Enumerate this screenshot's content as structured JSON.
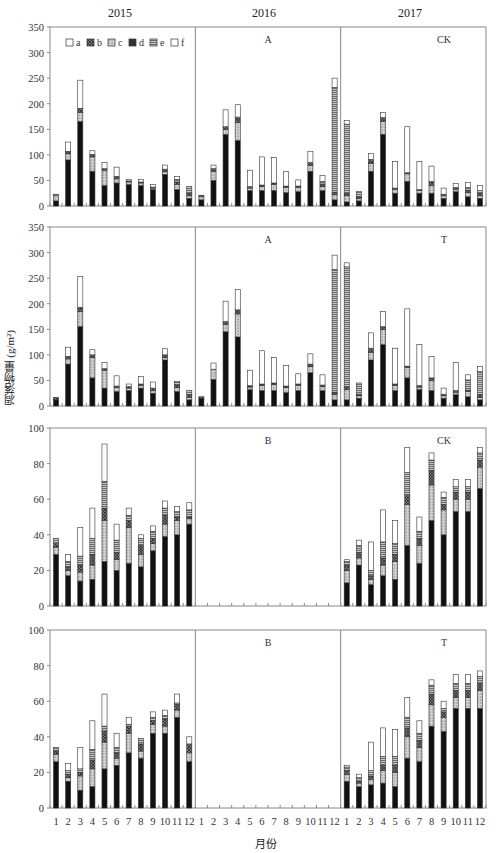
{
  "years": [
    "2015",
    "2016",
    "2017"
  ],
  "y_axis_label": "凋落物量 (g/m²)",
  "x_axis_label": "月份",
  "months": [
    "1",
    "2",
    "3",
    "4",
    "5",
    "6",
    "7",
    "8",
    "9",
    "10",
    "11",
    "12"
  ],
  "legend": [
    {
      "key": "a",
      "label": "a",
      "pattern": "white"
    },
    {
      "key": "b",
      "label": "b",
      "pattern": "crosshatch-dark"
    },
    {
      "key": "c",
      "label": "c",
      "pattern": "stipple-light"
    },
    {
      "key": "d",
      "label": "d",
      "pattern": "black"
    },
    {
      "key": "e",
      "label": "e",
      "pattern": "hlines"
    },
    {
      "key": "f",
      "label": "f",
      "pattern": "white"
    }
  ],
  "colors": {
    "d": "#111111",
    "b": "#6a6a6a",
    "c": "#b4b4b4",
    "e": "#8c8c8c",
    "f": "#ffffff",
    "axis": "#777777"
  },
  "chart_data": [
    {
      "type": "bar",
      "stacked": true,
      "panel_label_left": "A",
      "panel_label_right": "CK",
      "ylim": [
        0,
        350
      ],
      "yticks": [
        0,
        50,
        100,
        150,
        200,
        250,
        300,
        350
      ],
      "segment_order": [
        "d",
        "c",
        "b",
        "e",
        "f"
      ],
      "series_values": {
        "d": [
          10,
          90,
          165,
          68,
          40,
          45,
          42,
          40,
          32,
          62,
          32,
          15,
          12,
          50,
          140,
          128,
          30,
          30,
          30,
          26,
          28,
          68,
          30,
          12,
          8,
          10,
          68,
          140,
          25,
          48,
          25,
          25,
          15,
          28,
          18,
          15
        ],
        "c": [
          10,
          12,
          18,
          28,
          30,
          8,
          5,
          5,
          3,
          5,
          10,
          5,
          6,
          18,
          10,
          35,
          5,
          8,
          12,
          10,
          8,
          12,
          8,
          10,
          12,
          5,
          15,
          25,
          8,
          15,
          5,
          15,
          5,
          5,
          8,
          5
        ],
        "b": [
          0,
          5,
          8,
          5,
          3,
          5,
          2,
          2,
          2,
          5,
          5,
          5,
          3,
          5,
          5,
          8,
          3,
          3,
          3,
          3,
          3,
          5,
          5,
          5,
          5,
          3,
          8,
          8,
          2,
          2,
          2,
          8,
          3,
          3,
          5,
          5
        ],
        "e": [
          3,
          0,
          0,
          0,
          0,
          0,
          0,
          0,
          0,
          0,
          5,
          13,
          0,
          0,
          0,
          3,
          0,
          0,
          0,
          0,
          0,
          0,
          5,
          205,
          135,
          10,
          0,
          0,
          0,
          0,
          0,
          0,
          0,
          0,
          5,
          5
        ],
        "f": [
          0,
          18,
          55,
          7,
          12,
          18,
          3,
          5,
          5,
          8,
          6,
          0,
          0,
          7,
          33,
          24,
          32,
          55,
          50,
          28,
          12,
          22,
          12,
          18,
          7,
          0,
          12,
          10,
          52,
          90,
          55,
          30,
          12,
          8,
          10,
          10
        ]
      }
    },
    {
      "type": "bar",
      "stacked": true,
      "panel_label_left": "A",
      "panel_label_right": "T",
      "ylim": [
        0,
        350
      ],
      "yticks": [
        0,
        50,
        100,
        150,
        200,
        250,
        300,
        350
      ],
      "segment_order": [
        "d",
        "c",
        "b",
        "e",
        "f"
      ],
      "series_values": {
        "d": [
          12,
          82,
          155,
          55,
          35,
          28,
          30,
          35,
          25,
          90,
          28,
          12,
          15,
          52,
          145,
          135,
          32,
          30,
          30,
          26,
          30,
          65,
          30,
          12,
          12,
          15,
          90,
          120,
          30,
          55,
          32,
          30,
          15,
          22,
          18,
          12
        ],
        "c": [
          0,
          10,
          30,
          40,
          35,
          8,
          5,
          5,
          5,
          5,
          8,
          5,
          0,
          20,
          15,
          45,
          5,
          10,
          12,
          10,
          10,
          12,
          8,
          10,
          20,
          5,
          15,
          30,
          10,
          20,
          5,
          20,
          5,
          5,
          10,
          5
        ],
        "b": [
          5,
          5,
          8,
          5,
          3,
          3,
          3,
          3,
          5,
          5,
          5,
          5,
          3,
          0,
          5,
          8,
          3,
          3,
          3,
          3,
          3,
          5,
          3,
          5,
          5,
          3,
          8,
          5,
          3,
          3,
          3,
          5,
          3,
          3,
          3,
          5
        ],
        "e": [
          0,
          0,
          0,
          0,
          0,
          0,
          0,
          0,
          0,
          0,
          5,
          8,
          0,
          0,
          0,
          0,
          0,
          0,
          0,
          0,
          0,
          0,
          0,
          240,
          235,
          22,
          0,
          0,
          0,
          0,
          0,
          0,
          0,
          0,
          20,
          45
        ],
        "f": [
          0,
          18,
          60,
          10,
          12,
          20,
          5,
          15,
          12,
          12,
          2,
          0,
          0,
          12,
          40,
          40,
          30,
          65,
          50,
          40,
          20,
          20,
          20,
          28,
          8,
          0,
          30,
          30,
          70,
          112,
          80,
          42,
          12,
          55,
          10,
          10
        ]
      }
    },
    {
      "type": "bar",
      "stacked": true,
      "panel_label_left": "B",
      "panel_label_right": "CK",
      "ylim": [
        0,
        100
      ],
      "yticks": [
        0,
        20,
        40,
        60,
        80,
        100
      ],
      "segment_order": [
        "d",
        "c",
        "b",
        "e",
        "f"
      ],
      "series_values": {
        "d": [
          29,
          17,
          14,
          15,
          25,
          20,
          24,
          22,
          31,
          39,
          40,
          46,
          0,
          0,
          0,
          0,
          0,
          0,
          0,
          0,
          0,
          0,
          0,
          0,
          13,
          23,
          12,
          17,
          15,
          34,
          24,
          48,
          40,
          53,
          53,
          66
        ],
        "c": [
          4,
          3,
          5,
          8,
          23,
          6,
          20,
          7,
          4,
          7,
          8,
          3,
          0,
          0,
          0,
          0,
          0,
          0,
          0,
          0,
          0,
          0,
          0,
          0,
          7,
          4,
          3,
          6,
          10,
          23,
          10,
          20,
          14,
          7,
          7,
          12
        ],
        "b": [
          2,
          2,
          4,
          6,
          7,
          4,
          4,
          5,
          3,
          5,
          2,
          1,
          0,
          0,
          0,
          0,
          0,
          0,
          0,
          0,
          0,
          0,
          0,
          0,
          3,
          3,
          2,
          4,
          4,
          5,
          4,
          8,
          3,
          4,
          4,
          4
        ],
        "e": [
          3,
          3,
          5,
          9,
          15,
          7,
          3,
          4,
          4,
          4,
          3,
          4,
          0,
          0,
          0,
          0,
          0,
          0,
          0,
          0,
          0,
          0,
          0,
          0,
          2,
          4,
          3,
          9,
          6,
          13,
          4,
          6,
          4,
          3,
          3,
          4
        ],
        "f": [
          0,
          4,
          16,
          17,
          21,
          9,
          4,
          2,
          3,
          4,
          3,
          4,
          0,
          0,
          0,
          0,
          0,
          0,
          0,
          0,
          0,
          0,
          0,
          0,
          1,
          3,
          16,
          18,
          13,
          14,
          8,
          4,
          3,
          4,
          4,
          3
        ]
      }
    },
    {
      "type": "bar",
      "stacked": true,
      "panel_label_left": "B",
      "panel_label_right": "T",
      "ylim": [
        0,
        100
      ],
      "yticks": [
        0,
        20,
        40,
        60,
        80,
        100
      ],
      "segment_order": [
        "d",
        "c",
        "b",
        "e",
        "f"
      ],
      "series_values": {
        "d": [
          26,
          15,
          10,
          12,
          22,
          24,
          31,
          28,
          42,
          42,
          51,
          26,
          0,
          0,
          0,
          0,
          0,
          0,
          0,
          0,
          0,
          0,
          0,
          0,
          15,
          12,
          13,
          14,
          12,
          28,
          26,
          46,
          43,
          56,
          56,
          56
        ],
        "c": [
          4,
          2,
          8,
          10,
          15,
          4,
          11,
          4,
          5,
          4,
          4,
          5,
          0,
          0,
          0,
          0,
          0,
          0,
          0,
          0,
          0,
          0,
          0,
          0,
          4,
          2,
          3,
          7,
          8,
          12,
          8,
          12,
          8,
          6,
          6,
          10
        ],
        "b": [
          2,
          2,
          2,
          5,
          6,
          3,
          4,
          4,
          2,
          4,
          3,
          4,
          0,
          0,
          0,
          0,
          0,
          0,
          0,
          0,
          0,
          0,
          0,
          0,
          2,
          1,
          2,
          3,
          4,
          5,
          4,
          6,
          3,
          4,
          4,
          4
        ],
        "e": [
          2,
          2,
          2,
          6,
          3,
          3,
          1,
          3,
          2,
          2,
          1,
          1,
          0,
          0,
          0,
          0,
          0,
          0,
          0,
          0,
          0,
          0,
          0,
          0,
          2,
          2,
          3,
          5,
          5,
          6,
          4,
          5,
          2,
          4,
          4,
          4
        ],
        "f": [
          0,
          4,
          12,
          16,
          18,
          8,
          4,
          0,
          3,
          3,
          5,
          4,
          0,
          0,
          0,
          0,
          0,
          0,
          0,
          0,
          0,
          0,
          0,
          0,
          1,
          2,
          16,
          16,
          15,
          11,
          7,
          3,
          4,
          5,
          5,
          3
        ]
      }
    }
  ]
}
